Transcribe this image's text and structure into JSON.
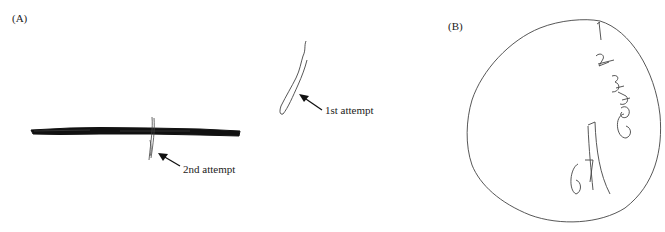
{
  "figure": {
    "panel_a": {
      "label": "(A)",
      "annotations": {
        "first": "1st attempt",
        "second": "2nd attempt"
      }
    },
    "panel_b": {
      "label": "(B)",
      "clock_digits": [
        "1",
        "2",
        "3",
        "4",
        "5",
        "6",
        "7",
        "6",
        "7"
      ]
    },
    "colors": {
      "ink": "#1a1a1a",
      "pencil": "#555555",
      "background": "#ffffff"
    }
  }
}
